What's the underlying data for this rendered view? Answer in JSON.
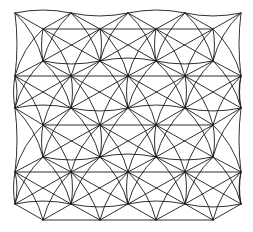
{
  "figure": {
    "stroke_color": "#1a1a1a",
    "background": "#ffffff",
    "rows_offset": [
      {
        "y": 13,
        "xs": [
          15,
          71,
          128,
          185,
          241
        ],
        "kind": "wavy"
      },
      {
        "y": 29,
        "xs": [
          43,
          100,
          156,
          213
        ],
        "kind": "straight"
      },
      {
        "y": 61,
        "xs": [
          43,
          100,
          156,
          213
        ],
        "kind": "wavy"
      },
      {
        "y": 76,
        "xs": [
          15,
          71,
          128,
          185,
          241
        ],
        "kind": "straight"
      },
      {
        "y": 108,
        "xs": [
          15,
          71,
          128,
          185,
          241
        ],
        "kind": "wavy"
      },
      {
        "y": 125,
        "xs": [
          43,
          100,
          156,
          213
        ],
        "kind": "straight"
      },
      {
        "y": 157,
        "xs": [
          43,
          100,
          156,
          213
        ],
        "kind": "wavy"
      },
      {
        "y": 172,
        "xs": [
          15,
          71,
          128,
          185,
          241
        ],
        "kind": "straight"
      },
      {
        "y": 204,
        "xs": [
          15,
          71,
          128,
          185,
          241
        ],
        "kind": "wavy"
      },
      {
        "y": 220,
        "xs": [
          43,
          100,
          156,
          213
        ],
        "kind": "straight"
      }
    ]
  }
}
